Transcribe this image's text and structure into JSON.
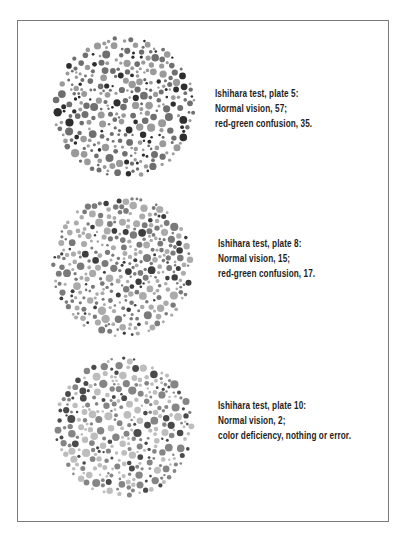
{
  "plates": [
    {
      "caption": {
        "title": "Ishihara test, plate 5:",
        "normal": "Normal vision, 57;",
        "deficient": "red-green confusion, 35."
      },
      "circle": {
        "cx": 124,
        "cy": 107,
        "r": 72
      },
      "colors": {
        "dark": "#2e2e2e",
        "mid": "#6f6f6f",
        "light": "#9a9a9a"
      },
      "seed": 5
    },
    {
      "caption": {
        "title": "Ishihara test, plate 8:",
        "normal": "Normal vision, 15;",
        "deficient": "red-green confusion, 17."
      },
      "circle": {
        "cx": 122,
        "cy": 266,
        "r": 72
      },
      "colors": {
        "dark": "#3e3e3e",
        "mid": "#7a7a7a",
        "light": "#ababab"
      },
      "seed": 8
    },
    {
      "caption": {
        "title": "Ishihara test, plate 10:",
        "normal": "Normal vision, 2;",
        "deficient": "color deficiency, nothing or error."
      },
      "circle": {
        "cx": 124,
        "cy": 427,
        "r": 71
      },
      "colors": {
        "dark": "#4a4a4a",
        "mid": "#858585",
        "light": "#bdbdbd"
      },
      "seed": 10
    }
  ],
  "frame": {
    "border_color": "#7a7a7a"
  }
}
